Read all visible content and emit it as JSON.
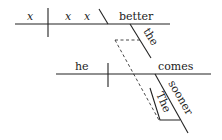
{
  "diagram": {
    "type": "reed-kellogg-sentence-diagram",
    "top_clause": {
      "subject": "x",
      "verb_words": [
        "x",
        "x"
      ],
      "complement": "better",
      "modifier": "the"
    },
    "bottom_clause": {
      "subject": "he",
      "verb": "comes",
      "modifiers": [
        "sooner",
        "The"
      ]
    },
    "connector": "dashed-line"
  }
}
